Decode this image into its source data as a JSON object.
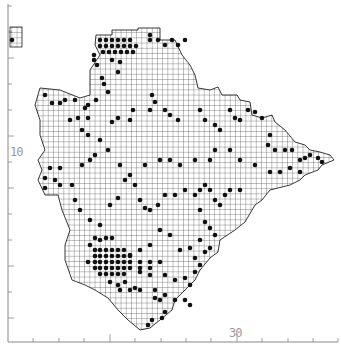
{
  "map": {
    "type": "distribution grid map",
    "grid_cell_px": 5.2,
    "colors": {
      "background": "#ffffff",
      "grid": "#222222",
      "dot": "#111111",
      "axis": "#888888",
      "label": "#999999"
    },
    "axes": {
      "y_label": "10",
      "x_label": "30",
      "y_ticks": [
        6,
        32,
        58,
        84,
        110,
        136,
        162,
        188,
        214,
        240,
        266,
        292,
        318
      ],
      "x_ticks": [
        33,
        59,
        84,
        110,
        135,
        161,
        186,
        211,
        237,
        262,
        288,
        313,
        338
      ]
    },
    "outline": [
      [
        96,
        35
      ],
      [
        112,
        35
      ],
      [
        112,
        30
      ],
      [
        138,
        30
      ],
      [
        138,
        28
      ],
      [
        160,
        28
      ],
      [
        160,
        40
      ],
      [
        175,
        40
      ],
      [
        182,
        55
      ],
      [
        190,
        65
      ],
      [
        195,
        75
      ],
      [
        198,
        88
      ],
      [
        210,
        90
      ],
      [
        218,
        87
      ],
      [
        222,
        95
      ],
      [
        237,
        95
      ],
      [
        240,
        100
      ],
      [
        250,
        102
      ],
      [
        252,
        115
      ],
      [
        262,
        118
      ],
      [
        272,
        115
      ],
      [
        275,
        122
      ],
      [
        285,
        130
      ],
      [
        295,
        142
      ],
      [
        305,
        145
      ],
      [
        310,
        150
      ],
      [
        320,
        152
      ],
      [
        330,
        155
      ],
      [
        334,
        160
      ],
      [
        322,
        165
      ],
      [
        318,
        170
      ],
      [
        305,
        175
      ],
      [
        300,
        180
      ],
      [
        290,
        185
      ],
      [
        270,
        190
      ],
      [
        262,
        200
      ],
      [
        255,
        205
      ],
      [
        245,
        222
      ],
      [
        235,
        230
      ],
      [
        220,
        240
      ],
      [
        218,
        252
      ],
      [
        210,
        258
      ],
      [
        200,
        270
      ],
      [
        195,
        280
      ],
      [
        185,
        290
      ],
      [
        175,
        300
      ],
      [
        172,
        310
      ],
      [
        160,
        320
      ],
      [
        150,
        328
      ],
      [
        140,
        330
      ],
      [
        128,
        320
      ],
      [
        118,
        310
      ],
      [
        108,
        298
      ],
      [
        95,
        290
      ],
      [
        85,
        285
      ],
      [
        72,
        280
      ],
      [
        65,
        260
      ],
      [
        65,
        245
      ],
      [
        70,
        230
      ],
      [
        62,
        210
      ],
      [
        58,
        195
      ],
      [
        45,
        195
      ],
      [
        38,
        180
      ],
      [
        42,
        170
      ],
      [
        38,
        160
      ],
      [
        45,
        150
      ],
      [
        40,
        135
      ],
      [
        40,
        120
      ],
      [
        35,
        105
      ],
      [
        40,
        88
      ],
      [
        60,
        90
      ],
      [
        80,
        98
      ],
      [
        90,
        95
      ],
      [
        90,
        70
      ],
      [
        100,
        55
      ],
      [
        95,
        45
      ]
    ],
    "inset": {
      "x": 10,
      "y": 27,
      "w": 12,
      "h": 20
    },
    "dots": [
      [
        100,
        40
      ],
      [
        106,
        40
      ],
      [
        112,
        40
      ],
      [
        118,
        40
      ],
      [
        124,
        40
      ],
      [
        130,
        40
      ],
      [
        100,
        46
      ],
      [
        106,
        46
      ],
      [
        112,
        46
      ],
      [
        118,
        46
      ],
      [
        124,
        46
      ],
      [
        130,
        46
      ],
      [
        136,
        46
      ],
      [
        103,
        52
      ],
      [
        109,
        52
      ],
      [
        115,
        52
      ],
      [
        121,
        52
      ],
      [
        127,
        52
      ],
      [
        133,
        52
      ],
      [
        94,
        55
      ],
      [
        94,
        60
      ],
      [
        97,
        65
      ],
      [
        150,
        35
      ],
      [
        150,
        40
      ],
      [
        158,
        40
      ],
      [
        165,
        45
      ],
      [
        172,
        40
      ],
      [
        178,
        45
      ],
      [
        185,
        40
      ],
      [
        112,
        60
      ],
      [
        120,
        62
      ],
      [
        118,
        72
      ],
      [
        102,
        78
      ],
      [
        104,
        84
      ],
      [
        108,
        92
      ],
      [
        96,
        100
      ],
      [
        88,
        105
      ],
      [
        45,
        95
      ],
      [
        52,
        103
      ],
      [
        60,
        103
      ],
      [
        65,
        100
      ],
      [
        75,
        100
      ],
      [
        85,
        108
      ],
      [
        70,
        120
      ],
      [
        78,
        118
      ],
      [
        88,
        118
      ],
      [
        82,
        130
      ],
      [
        88,
        135
      ],
      [
        112,
        122
      ],
      [
        118,
        118
      ],
      [
        133,
        110
      ],
      [
        130,
        120
      ],
      [
        150,
        110
      ],
      [
        155,
        102
      ],
      [
        152,
        95
      ],
      [
        165,
        110
      ],
      [
        170,
        115
      ],
      [
        178,
        120
      ],
      [
        200,
        110
      ],
      [
        205,
        120
      ],
      [
        215,
        125
      ],
      [
        220,
        130
      ],
      [
        230,
        110
      ],
      [
        235,
        118
      ],
      [
        240,
        120
      ],
      [
        248,
        110
      ],
      [
        255,
        112
      ],
      [
        262,
        118
      ],
      [
        270,
        135
      ],
      [
        268,
        145
      ],
      [
        275,
        150
      ],
      [
        285,
        150
      ],
      [
        292,
        150
      ],
      [
        300,
        160
      ],
      [
        305,
        158
      ],
      [
        310,
        155
      ],
      [
        318,
        158
      ],
      [
        322,
        162
      ],
      [
        300,
        172
      ],
      [
        290,
        168
      ],
      [
        280,
        172
      ],
      [
        270,
        172
      ],
      [
        255,
        165
      ],
      [
        240,
        160
      ],
      [
        230,
        150
      ],
      [
        215,
        150
      ],
      [
        210,
        160
      ],
      [
        195,
        160
      ],
      [
        180,
        165
      ],
      [
        170,
        160
      ],
      [
        160,
        160
      ],
      [
        145,
        165
      ],
      [
        130,
        175
      ],
      [
        120,
        165
      ],
      [
        108,
        150
      ],
      [
        100,
        140
      ],
      [
        95,
        155
      ],
      [
        90,
        160
      ],
      [
        82,
        165
      ],
      [
        60,
        168
      ],
      [
        50,
        168
      ],
      [
        45,
        178
      ],
      [
        55,
        180
      ],
      [
        60,
        185
      ],
      [
        45,
        188
      ],
      [
        72,
        185
      ],
      [
        75,
        200
      ],
      [
        80,
        210
      ],
      [
        90,
        220
      ],
      [
        100,
        225
      ],
      [
        110,
        205
      ],
      [
        118,
        198
      ],
      [
        125,
        180
      ],
      [
        135,
        185
      ],
      [
        140,
        200
      ],
      [
        145,
        208
      ],
      [
        150,
        210
      ],
      [
        158,
        205
      ],
      [
        165,
        195
      ],
      [
        175,
        195
      ],
      [
        185,
        190
      ],
      [
        195,
        195
      ],
      [
        200,
        190
      ],
      [
        205,
        185
      ],
      [
        210,
        190
      ],
      [
        215,
        200
      ],
      [
        220,
        205
      ],
      [
        225,
        195
      ],
      [
        230,
        190
      ],
      [
        240,
        190
      ],
      [
        200,
        210
      ],
      [
        205,
        222
      ],
      [
        210,
        228
      ],
      [
        215,
        235
      ],
      [
        200,
        240
      ],
      [
        190,
        248
      ],
      [
        180,
        250
      ],
      [
        170,
        235
      ],
      [
        160,
        230
      ],
      [
        150,
        245
      ],
      [
        140,
        250
      ],
      [
        130,
        255
      ],
      [
        95,
        238
      ],
      [
        100,
        240
      ],
      [
        106,
        238
      ],
      [
        112,
        238
      ],
      [
        90,
        245
      ],
      [
        95,
        250
      ],
      [
        100,
        250
      ],
      [
        106,
        250
      ],
      [
        112,
        250
      ],
      [
        118,
        250
      ],
      [
        124,
        250
      ],
      [
        95,
        256
      ],
      [
        100,
        256
      ],
      [
        106,
        256
      ],
      [
        112,
        256
      ],
      [
        118,
        256
      ],
      [
        124,
        256
      ],
      [
        130,
        256
      ],
      [
        88,
        262
      ],
      [
        95,
        262
      ],
      [
        100,
        262
      ],
      [
        106,
        262
      ],
      [
        112,
        262
      ],
      [
        118,
        262
      ],
      [
        124,
        262
      ],
      [
        130,
        262
      ],
      [
        140,
        262
      ],
      [
        150,
        262
      ],
      [
        160,
        262
      ],
      [
        95,
        268
      ],
      [
        100,
        268
      ],
      [
        106,
        268
      ],
      [
        112,
        268
      ],
      [
        118,
        268
      ],
      [
        124,
        268
      ],
      [
        130,
        268
      ],
      [
        140,
        268
      ],
      [
        150,
        268
      ],
      [
        100,
        274
      ],
      [
        106,
        274
      ],
      [
        112,
        274
      ],
      [
        118,
        274
      ],
      [
        124,
        274
      ],
      [
        140,
        272
      ],
      [
        150,
        275
      ],
      [
        165,
        275
      ],
      [
        175,
        280
      ],
      [
        185,
        278
      ],
      [
        195,
        272
      ],
      [
        200,
        265
      ],
      [
        110,
        282
      ],
      [
        118,
        285
      ],
      [
        125,
        282
      ],
      [
        135,
        288
      ],
      [
        140,
        290
      ],
      [
        155,
        290
      ],
      [
        165,
        295
      ],
      [
        175,
        300
      ],
      [
        185,
        300
      ],
      [
        190,
        305
      ],
      [
        165,
        312
      ],
      [
        152,
        320
      ],
      [
        162,
        318
      ],
      [
        148,
        325
      ],
      [
        190,
        285
      ],
      [
        195,
        258
      ],
      [
        205,
        252
      ],
      [
        210,
        248
      ],
      [
        155,
        298
      ],
      [
        160,
        300
      ],
      [
        130,
        290
      ],
      [
        120,
        290
      ],
      [
        12,
        40
      ]
    ]
  }
}
